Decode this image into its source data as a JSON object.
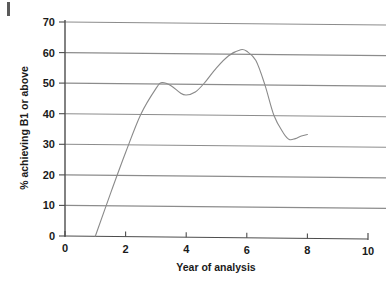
{
  "figure": {
    "name": "line-chart-percent-achieving-b1",
    "background_color": "#ffffff",
    "artifact_label": ""
  },
  "chart_data": {
    "type": "line",
    "title": "",
    "xlabel": "Year of analysis",
    "ylabel": "% achieving B1 or above",
    "xlim": [
      0,
      10
    ],
    "ylim": [
      0,
      70
    ],
    "xticks": [
      0,
      2,
      4,
      6,
      8,
      10
    ],
    "xtick_labels": [
      "0",
      "2",
      "4",
      "6",
      "8",
      "10"
    ],
    "yticks": [
      0,
      10,
      20,
      30,
      40,
      50,
      60,
      70
    ],
    "ytick_labels": [
      "0",
      "10",
      "20",
      "30",
      "40",
      "50",
      "60",
      "70"
    ],
    "grid": {
      "horizontal": true,
      "vertical": false,
      "color": "#8c8c8c"
    },
    "legend": null,
    "series": [
      {
        "name": "% achieving B1 or above",
        "color": "#8a8a8a",
        "line_width": 1.1,
        "marker": "none",
        "x": [
          1.0,
          1.5,
          2.0,
          2.5,
          3.0,
          3.2,
          3.5,
          3.8,
          4.0,
          4.3,
          4.6,
          5.0,
          5.4,
          5.8,
          6.0,
          6.3,
          6.6,
          6.9,
          7.2,
          7.4,
          7.6,
          7.8,
          8.0
        ],
        "y": [
          0,
          14,
          27.5,
          40,
          48.5,
          50.5,
          49.5,
          47.2,
          46.5,
          47.5,
          50.5,
          55.5,
          59.5,
          61.5,
          61.0,
          58.0,
          50.0,
          40.0,
          34.5,
          32.3,
          32.6,
          33.5,
          34.0
        ]
      }
    ],
    "annotations": []
  },
  "axes": {
    "x_axis_name": "x-axis",
    "y_axis_name": "y-axis",
    "axis_color": "#4d4d4d"
  }
}
